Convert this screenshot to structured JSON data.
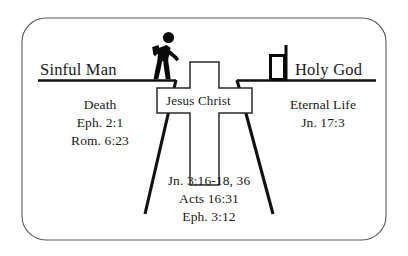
{
  "diagram": {
    "colors": {
      "ink": "#1a1a1a",
      "line": "#111111",
      "border": "#555555",
      "background": "#ffffff"
    },
    "left": {
      "heading": "Sinful Man",
      "figure_icon": "walking-man-icon",
      "lines": [
        "Death",
        "Eph. 2:1",
        "Rom. 6:23"
      ]
    },
    "right": {
      "heading": "Holy God",
      "figure_icon": "flag-icon",
      "lines": [
        "Eternal Life",
        "Jn. 17:3"
      ]
    },
    "center": {
      "cross_label": "Jesus Christ",
      "cross_icon": "cross-icon",
      "lines": [
        "Jn. 3:16-18, 36",
        "Acts 16:31",
        "Eph. 3:12"
      ]
    }
  }
}
